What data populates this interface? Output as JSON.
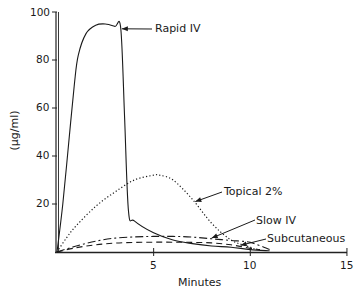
{
  "chart_data": {
    "type": "line",
    "title": "",
    "xlabel": "Minutes",
    "ylabel": "(μg/ml)",
    "xlim": [
      0,
      15
    ],
    "ylim": [
      0,
      100
    ],
    "x_ticks": [
      5,
      10,
      15
    ],
    "y_ticks": [
      20,
      40,
      60,
      80,
      100
    ],
    "grid": false,
    "legend": "inline annotations with arrows",
    "series": [
      {
        "name": "Rapid IV",
        "style": "solid",
        "x": [
          0,
          0.3,
          0.6,
          0.9,
          1.1,
          1.5,
          2.0,
          2.5,
          3.0,
          3.3,
          3.5,
          3.7,
          4.0,
          5.0,
          6.0,
          7.0,
          8.0,
          9.0,
          10.0,
          11.0
        ],
        "y": [
          0,
          20,
          45,
          70,
          82,
          91,
          94.5,
          95,
          94,
          93,
          55,
          17,
          13,
          8,
          5,
          3.5,
          2.5,
          2,
          1,
          0.5
        ]
      },
      {
        "name": "Topical 2%",
        "style": "dotted",
        "x": [
          0,
          0.5,
          1,
          2,
          3,
          4,
          5,
          5.3,
          6,
          7,
          8,
          9,
          10,
          10.3
        ],
        "y": [
          0,
          6,
          11,
          19,
          25,
          30,
          32,
          32,
          30,
          22,
          12,
          5,
          2,
          1
        ]
      },
      {
        "name": "Slow IV",
        "style": "dash-dot",
        "x": [
          0,
          1,
          2,
          3,
          4,
          5,
          6,
          7,
          8,
          9,
          10,
          11
        ],
        "y": [
          0,
          2.5,
          4.5,
          5.8,
          6.3,
          6.5,
          6.5,
          6.2,
          5.5,
          4.8,
          4,
          1
        ]
      },
      {
        "name": "Subcutaneous",
        "style": "dashed",
        "x": [
          0,
          1,
          2,
          3,
          4,
          5,
          6,
          7,
          8,
          9,
          10,
          10.5
        ],
        "y": [
          0,
          1.8,
          3,
          3.7,
          4,
          4.1,
          4.1,
          4,
          3.8,
          3,
          1.5,
          1
        ]
      }
    ],
    "annotations": [
      {
        "text": "Rapid IV",
        "arrow_to": [
          3.2,
          93
        ]
      },
      {
        "text": "Topical 2%",
        "arrow_to": [
          7,
          21
        ]
      },
      {
        "text": "Slow IV",
        "arrow_to": [
          8,
          5.8
        ]
      },
      {
        "text": "Subcutaneous",
        "arrow_to": [
          9.5,
          2.8
        ]
      }
    ]
  },
  "labels": {
    "rapid_iv": "Rapid IV",
    "topical": "Topical 2%",
    "slow_iv": "Slow IV",
    "subcutaneous": "Subcutaneous",
    "xlabel": "Minutes",
    "ylabel": "(μg/ml)",
    "y100": "100",
    "y80": "80",
    "y60": "60",
    "y40": "40",
    "y20": "20",
    "x5": "5",
    "x10": "10",
    "x15": "15"
  }
}
